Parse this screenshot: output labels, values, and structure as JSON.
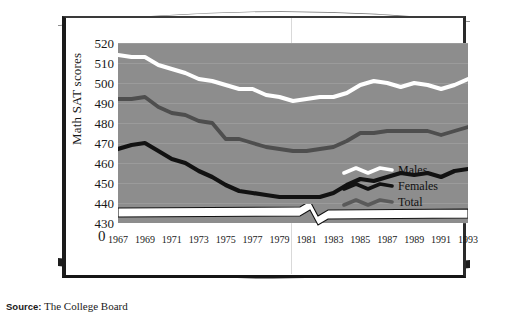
{
  "page": {
    "source_label": "Source:",
    "source_text": "The College Board"
  },
  "chart_data": {
    "type": "line",
    "title": "",
    "xlabel": "",
    "ylabel": "Math SAT scores",
    "ylim": [
      430,
      520
    ],
    "yticks": [
      520,
      510,
      500,
      490,
      480,
      470,
      460,
      450,
      440,
      430
    ],
    "y_break_tick": "0",
    "axis_break": true,
    "grid": true,
    "legend_position": "inside bottom-right",
    "x": [
      1967,
      1968,
      1969,
      1970,
      1971,
      1972,
      1973,
      1974,
      1975,
      1976,
      1977,
      1978,
      1979,
      1980,
      1981,
      1982,
      1983,
      1984,
      1985,
      1986,
      1987,
      1988,
      1989,
      1990,
      1991,
      1992,
      1993
    ],
    "xtick_labels": [
      "1967",
      "1969",
      "1971",
      "1973",
      "1975",
      "1977",
      "1979",
      "1981",
      "1983",
      "1985",
      "1987",
      "1989",
      "1991",
      "1993"
    ],
    "series": [
      {
        "name": "Males",
        "color": "#ffffff",
        "values": [
          514,
          513,
          513,
          509,
          507,
          505,
          502,
          501,
          499,
          497,
          497,
          494,
          493,
          491,
          492,
          493,
          493,
          495,
          499,
          501,
          500,
          498,
          500,
          499,
          497,
          499,
          502
        ]
      },
      {
        "name": "Females",
        "color": "#121212",
        "values": [
          467,
          469,
          470,
          466,
          462,
          460,
          456,
          453,
          449,
          446,
          445,
          444,
          443,
          443,
          443,
          443,
          445,
          449,
          452,
          451,
          453,
          455,
          454,
          455,
          453,
          456,
          457
        ]
      },
      {
        "name": "Total",
        "color": "#4e4e4e",
        "values": [
          492,
          492,
          493,
          488,
          485,
          484,
          481,
          480,
          472,
          472,
          470,
          468,
          467,
          466,
          466,
          467,
          468,
          471,
          475,
          475,
          476,
          476,
          476,
          476,
          474,
          476,
          478
        ]
      }
    ]
  },
  "legend": {
    "items": [
      {
        "label": "Males",
        "color": "#ffffff"
      },
      {
        "label": "Females",
        "color": "#121212"
      },
      {
        "label": "Total",
        "color": "#5a5a5a"
      }
    ]
  },
  "colors": {
    "plot_background": "#8d8d8d",
    "page_background": "#ffffff",
    "frame": "#1b1b1b"
  }
}
